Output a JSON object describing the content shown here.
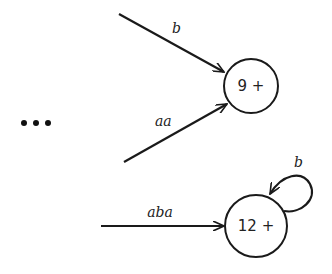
{
  "diagram": {
    "type": "finite-automaton-fragment",
    "ellipsis": "...",
    "states": [
      {
        "id": "s9",
        "label": "9 +"
      },
      {
        "id": "s12",
        "label": "12 +"
      }
    ],
    "edges": [
      {
        "id": "e1",
        "to": "s9",
        "label": "b"
      },
      {
        "id": "e2",
        "to": "s9",
        "label": "aa"
      },
      {
        "id": "e3",
        "to": "s12",
        "label": "aba"
      },
      {
        "id": "e4",
        "from": "s12",
        "to": "s12",
        "label": "b",
        "loop": true
      }
    ]
  }
}
